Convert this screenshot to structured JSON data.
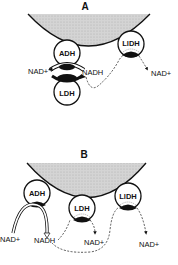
{
  "panels": {
    "A": {
      "label": "A",
      "enzymes": {
        "adh": "ADH",
        "ldh": "LDH",
        "lidh": "LlDH"
      },
      "labels": {
        "nad_left": "NAD+",
        "nadh": "NADH",
        "nad_right": "NAD+"
      }
    },
    "B": {
      "label": "B",
      "enzymes": {
        "adh": "ADH",
        "ldh": "LDH",
        "lidh": "LlDH"
      },
      "labels": {
        "nad_left": "NAD+",
        "nadh": "NADH",
        "nad_mid": "NAD+",
        "nad_right": "NAD+"
      }
    }
  },
  "colors": {
    "membrane_fill": "#cfcfcf",
    "stroke": "#111111",
    "background": "#ffffff"
  }
}
